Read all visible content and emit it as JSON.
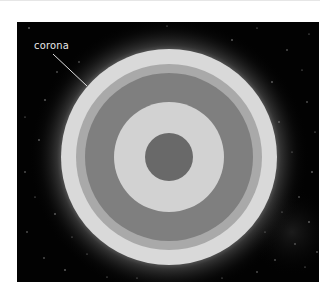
{
  "diagram": {
    "background": "#020202",
    "labels": [
      {
        "text": "corona",
        "target": "outer-layer"
      }
    ],
    "layers": [
      {
        "name": "corona",
        "radius": 108,
        "color": "#d9d9d9"
      },
      {
        "name": "chromosphere",
        "radius": 93,
        "color": "#a9a9a9"
      },
      {
        "name": "convective-zone",
        "radius": 84,
        "color": "#7f7f7f"
      },
      {
        "name": "radiative-zone",
        "radius": 55,
        "color": "#d2d2d2"
      },
      {
        "name": "core",
        "radius": 24,
        "color": "#696969"
      }
    ],
    "glow_color": "#ffffff"
  }
}
